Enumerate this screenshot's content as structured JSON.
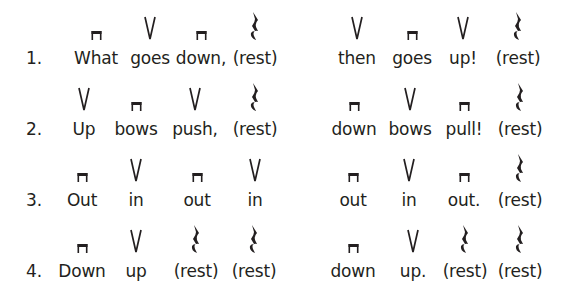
{
  "symbols": {
    "down": "down-bow-icon",
    "up": "up-bow-icon",
    "rest": "quarter-rest-icon"
  },
  "lines": [
    {
      "number": "1.",
      "left": [
        {
          "word": "What",
          "symbol": "down"
        },
        {
          "word": "goes",
          "symbol": "up"
        },
        {
          "word": "down,",
          "symbol": "down"
        },
        {
          "word": "(rest)",
          "symbol": "rest"
        }
      ],
      "right": [
        {
          "word": "then",
          "symbol": "up"
        },
        {
          "word": "goes",
          "symbol": "down"
        },
        {
          "word": "up!",
          "symbol": "up"
        },
        {
          "word": "(rest)",
          "symbol": "rest"
        }
      ]
    },
    {
      "number": "2.",
      "left": [
        {
          "word": "Up",
          "symbol": "up"
        },
        {
          "word": "bows",
          "symbol": "down"
        },
        {
          "word": "push,",
          "symbol": "up"
        },
        {
          "word": "(rest)",
          "symbol": "rest"
        }
      ],
      "right": [
        {
          "word": "down",
          "symbol": "down"
        },
        {
          "word": "bows",
          "symbol": "up"
        },
        {
          "word": "pull!",
          "symbol": "down"
        },
        {
          "word": "(rest)",
          "symbol": "rest"
        }
      ]
    },
    {
      "number": "3.",
      "left": [
        {
          "word": "Out",
          "symbol": "down"
        },
        {
          "word": "in",
          "symbol": "up"
        },
        {
          "word": "out",
          "symbol": "down"
        },
        {
          "word": "in",
          "symbol": "up"
        }
      ],
      "right": [
        {
          "word": "out",
          "symbol": "down"
        },
        {
          "word": "in",
          "symbol": "up"
        },
        {
          "word": "out.",
          "symbol": "down"
        },
        {
          "word": "(rest)",
          "symbol": "rest"
        }
      ]
    },
    {
      "number": "4.",
      "left": [
        {
          "word": "Down",
          "symbol": "down"
        },
        {
          "word": "up",
          "symbol": "up"
        },
        {
          "word": "(rest)",
          "symbol": "rest"
        },
        {
          "word": "(rest)",
          "symbol": "rest"
        }
      ],
      "right": [
        {
          "word": "down",
          "symbol": "down"
        },
        {
          "word": "up.",
          "symbol": "up"
        },
        {
          "word": "(rest)",
          "symbol": "rest"
        },
        {
          "word": "(rest)",
          "symbol": "rest"
        }
      ]
    }
  ]
}
